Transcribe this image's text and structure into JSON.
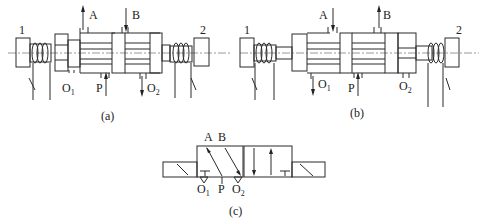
{
  "figure": {
    "panels": [
      {
        "id": "a",
        "caption": "(a)",
        "solenoid_left_label": "1",
        "solenoid_right_label": "2",
        "ports": {
          "A": "A",
          "B": "B",
          "P": "P",
          "O1": "O",
          "O1_sub": "1",
          "O2": "O",
          "O2_sub": "2"
        },
        "flow": {
          "A": "up-out",
          "B": "down-in",
          "P": "up-in",
          "O2": "down-out"
        }
      },
      {
        "id": "b",
        "caption": "(b)",
        "solenoid_left_label": "1",
        "solenoid_right_label": "2",
        "ports": {
          "A": "A",
          "B": "B",
          "P": "P",
          "O1": "O",
          "O1_sub": "1",
          "O2": "O",
          "O2_sub": "2"
        },
        "flow": {
          "A": "down-in",
          "B": "up-out",
          "P": "up-in",
          "O1": "down-out"
        }
      },
      {
        "id": "c",
        "caption": "(c)",
        "symbol": "3-position 5-way solenoid valve (graphic symbol)",
        "ports": {
          "A": "A",
          "B": "B",
          "P": "P",
          "O1": "O",
          "O1_sub": "1",
          "O2": "O",
          "O2_sub": "2"
        }
      }
    ]
  }
}
